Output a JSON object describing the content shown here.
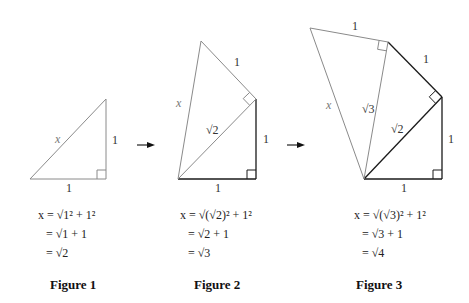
{
  "figures": [
    {
      "id": 1,
      "title": "Figure 1",
      "labels": {
        "hyp": "x",
        "leg_vertical": "1",
        "leg_horizontal": "1"
      },
      "equations": [
        "x = √1² + 1²",
        "= √1 + 1",
        "= √2"
      ]
    },
    {
      "id": 2,
      "title": "Figure 2",
      "labels": {
        "hyp": "x",
        "new_leg": "1",
        "diag": "√2",
        "leg_vertical": "1",
        "leg_horizontal": "1"
      },
      "equations": [
        "x = √(√2)² + 1²",
        "= √2 + 1",
        "= √3"
      ]
    },
    {
      "id": 3,
      "title": "Figure 3",
      "labels": {
        "hyp": "x",
        "new_leg": "1",
        "sqrt3": "√3",
        "leg_top": "1",
        "diag": "√2",
        "leg_vertical": "1",
        "leg_horizontal": "1"
      },
      "equations": [
        "x = √(√3)² + 1²",
        "= √3 + 1",
        "= √4"
      ]
    }
  ],
  "colors": {
    "new_lines": "#8a8a8a",
    "old_lines": "#1a1a1a",
    "text": "#222222"
  }
}
